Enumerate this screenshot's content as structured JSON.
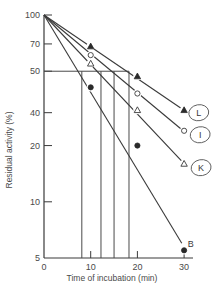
{
  "chart_data": {
    "type": "line",
    "title": "",
    "xlabel": "Time of incubation  (min)",
    "ylabel": "Residual activity (%)",
    "xlim": [
      0,
      32
    ],
    "ylim": [
      5,
      100
    ],
    "yscale": "log",
    "x_ticks": [
      {
        "value": 0,
        "label": "0"
      },
      {
        "value": 10,
        "label": "10"
      },
      {
        "value": 20,
        "label": "20"
      },
      {
        "value": 30,
        "label": "30"
      }
    ],
    "y_ticks": [
      {
        "value": 100,
        "label": "100"
      },
      {
        "value": 70,
        "label": "70"
      },
      {
        "value": 50,
        "label": "50"
      },
      {
        "value": 30,
        "label": "40"
      },
      {
        "value": 20,
        "label": "20"
      },
      {
        "value": 10,
        "label": "10"
      },
      {
        "value": 5,
        "label": "5"
      }
    ],
    "grid": false,
    "reference_line_y": 50,
    "half_life_times": [
      8.1,
      12.2,
      15.0,
      18.2
    ],
    "series": [
      {
        "name": "L",
        "marker": "filled-triangle",
        "line": [
          [
            0,
            100
          ],
          [
            29.5,
            31.5
          ]
        ],
        "x": [
          10,
          20,
          30
        ],
        "y": [
          68,
          47,
          31
        ]
      },
      {
        "name": "I",
        "marker": "open-circle",
        "line": [
          [
            0,
            100
          ],
          [
            29.8,
            24
          ]
        ],
        "x": [
          10,
          20,
          30
        ],
        "y": [
          61,
          38,
          24
        ]
      },
      {
        "name": "K",
        "marker": "open-triangle",
        "line": [
          [
            0,
            100
          ],
          [
            30,
            16
          ]
        ],
        "x": [
          10,
          20,
          30
        ],
        "y": [
          55,
          31,
          16
        ]
      },
      {
        "name": "B",
        "marker": "filled-circle",
        "line": [
          [
            0,
            100
          ],
          [
            29.5,
            6
          ]
        ],
        "x": [
          10,
          20,
          30
        ],
        "y": [
          41,
          20,
          5.5
        ]
      }
    ],
    "legend": "inline-labels-right",
    "circled_labels": [
      "L",
      "I",
      "K"
    ]
  }
}
